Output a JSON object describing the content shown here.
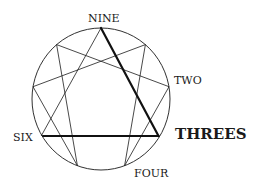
{
  "diagram": {
    "type": "enneagram",
    "highlighted_type": "THREES",
    "labels": {
      "nine": "NINE",
      "two": "TWO",
      "threes": "THREES",
      "four": "FOUR",
      "six": "SIX"
    },
    "colors": {
      "line": "#1a1a1a",
      "background": "#ffffff"
    },
    "bold_edges": [
      [
        "9",
        "3"
      ],
      [
        "3",
        "6"
      ]
    ],
    "thin_edges": [
      [
        "6",
        "9"
      ],
      [
        "1",
        "4"
      ],
      [
        "4",
        "2"
      ],
      [
        "2",
        "8"
      ],
      [
        "8",
        "5"
      ],
      [
        "5",
        "7"
      ],
      [
        "7",
        "1"
      ]
    ]
  }
}
